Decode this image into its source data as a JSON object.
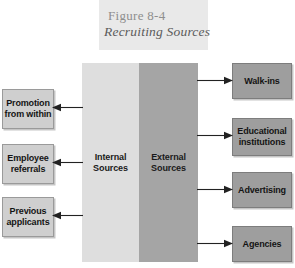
{
  "figure": {
    "number": "Figure 8-4",
    "title": "Recruiting Sources"
  },
  "colors": {
    "internal_column": "#dedede",
    "external_column": "#a5a5a5",
    "left_box": "#cfcfcf",
    "right_box": "#9e9e9e",
    "title_plate": "#e9e9e9",
    "arrow": "#222222",
    "title_number_text": "#8e8e8e",
    "title_text": "#5b5b5b"
  },
  "center": {
    "internal": {
      "line1": "Internal",
      "line2": "Sources"
    },
    "external": {
      "line1": "External",
      "line2": "Sources"
    }
  },
  "internal_sources": [
    {
      "line1": "Promotion",
      "line2": "from within"
    },
    {
      "line1": "Employee",
      "line2": "referrals"
    },
    {
      "line1": "Previous",
      "line2": "applicants"
    }
  ],
  "external_sources": [
    {
      "line1": "Walk-ins",
      "line2": ""
    },
    {
      "line1": "Educational",
      "line2": "institutions"
    },
    {
      "line1": "Advertising",
      "line2": ""
    },
    {
      "line1": "Agencies",
      "line2": ""
    }
  ],
  "arrows": {
    "left_direction": "left",
    "right_direction": "right",
    "left_count": 3,
    "right_count": 4
  }
}
